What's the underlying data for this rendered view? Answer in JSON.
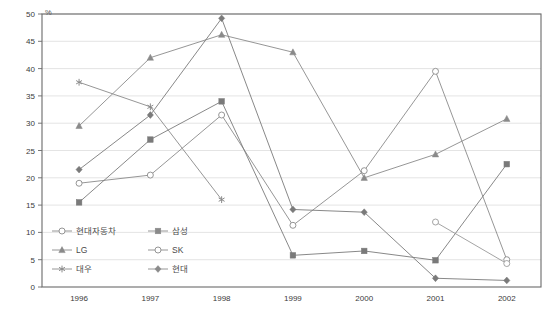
{
  "chart_data": {
    "type": "line",
    "title": "",
    "xlabel": "",
    "ylabel": "%",
    "unit": "%",
    "grid": true,
    "legend_position": "inside-bottom-left",
    "categories": [
      "1996",
      "1997",
      "1998",
      "1999",
      "2000",
      "2001",
      "2002"
    ],
    "x": [
      1996,
      1997,
      1998,
      1999,
      2000,
      2001,
      2002
    ],
    "ylim": [
      0,
      50
    ],
    "ytick_step": 5,
    "yticks": [
      "0",
      "5",
      "10",
      "15",
      "20",
      "25",
      "30",
      "35",
      "40",
      "45",
      "50"
    ],
    "series": [
      {
        "name": "현대자동차",
        "marker": "open-circle",
        "color": "#8a8a8a",
        "values": [
          19.0,
          20.5,
          31.5,
          11.3,
          21.3,
          39.5,
          5.0
        ]
      },
      {
        "name": "삼성",
        "marker": "filled-square",
        "color": "#7a7a7a",
        "values": [
          15.5,
          27.0,
          34.0,
          5.8,
          6.6,
          4.9,
          22.5
        ]
      },
      {
        "name": "LG",
        "marker": "filled-triangle",
        "color": "#8a8a8a",
        "values": [
          29.5,
          42.0,
          46.2,
          43.0,
          20.0,
          24.3,
          30.8
        ]
      },
      {
        "name": "SK",
        "marker": "open-circle",
        "color": "#9a9a9a",
        "values": [
          null,
          null,
          null,
          null,
          null,
          11.9,
          4.3
        ]
      },
      {
        "name": "대우",
        "marker": "asterisk",
        "color": "#8a8a8a",
        "values": [
          37.5,
          33.0,
          16.0,
          null,
          null,
          null,
          null
        ]
      },
      {
        "name": "현대",
        "marker": "filled-diamond",
        "color": "#7a7a7a",
        "values": [
          21.5,
          31.5,
          49.2,
          14.2,
          13.7,
          1.6,
          1.2
        ]
      }
    ]
  },
  "legend": {
    "entries": [
      {
        "label": "현대자동차",
        "marker": "open-circle"
      },
      {
        "label": "삼성",
        "marker": "filled-square"
      },
      {
        "label": "LG",
        "marker": "filled-triangle"
      },
      {
        "label": "SK",
        "marker": "open-circle"
      },
      {
        "label": "대우",
        "marker": "asterisk"
      },
      {
        "label": "현대",
        "marker": "filled-diamond"
      }
    ]
  },
  "colors": {
    "line": "#8a8a8a",
    "grid": "#d8d8d8",
    "axis": "#6a6a6a",
    "text": "#3a3a3a",
    "background": "#ffffff"
  }
}
